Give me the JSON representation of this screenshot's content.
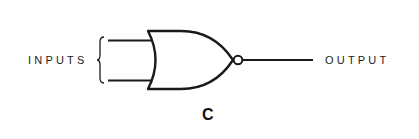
{
  "diagram": {
    "type": "logic-gate",
    "gate": "NOR",
    "labels": {
      "inputs": "INPUTS",
      "output": "OUTPUT",
      "caption": "C"
    },
    "colors": {
      "stroke": "#1a1a1a",
      "text": "#222222",
      "background": "#ffffff"
    },
    "inputs_count": 2,
    "has_inversion_bubble": true
  }
}
